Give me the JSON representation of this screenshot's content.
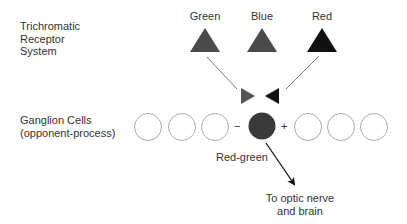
{
  "left_labels": {
    "receptor_line1": "Trichromatic",
    "receptor_line2": "Receptor",
    "receptor_line3": "System",
    "ganglion_line1": "Ganglion Cells",
    "ganglion_line2": "(opponent-process)"
  },
  "receptors": [
    {
      "label": "Green",
      "color": "#4a4a4a"
    },
    {
      "label": "Blue",
      "color": "#4a4a4a"
    },
    {
      "label": "Red",
      "color": "#111111"
    }
  ],
  "inputs": {
    "excitatory_color": "#555555",
    "inhibitory_color": "#111111"
  },
  "ganglion": {
    "minus_sign": "−",
    "plus_sign": "+",
    "active_cell_color": "#3a3a3a",
    "channel_label": "Red-green"
  },
  "output": {
    "line1": "To optic nerve",
    "line2": "and brain"
  }
}
